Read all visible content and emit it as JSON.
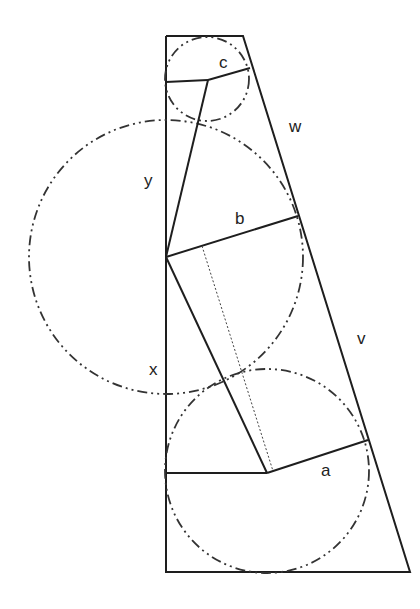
{
  "diagram": {
    "labels": {
      "a": "a",
      "b": "b",
      "c": "c",
      "v": "v",
      "w": "w",
      "x": "x",
      "y": "y"
    },
    "colors": {
      "stroke": "#1e1e1e",
      "background": "#ffffff"
    }
  }
}
